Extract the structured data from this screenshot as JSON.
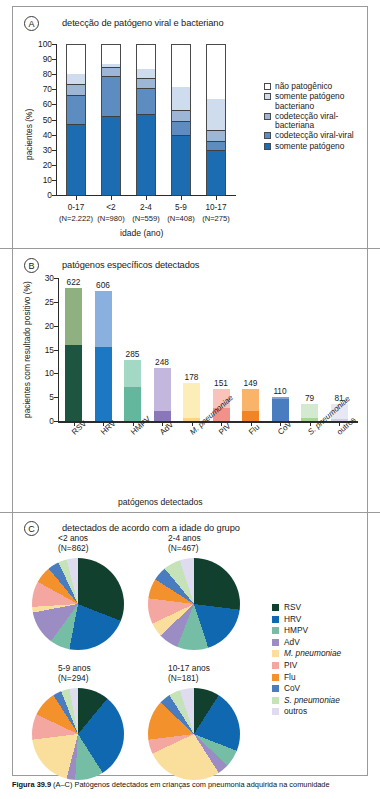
{
  "figure": {
    "caption_label": "Figura 39.9",
    "caption_text": "(A–C) Patógenos detectados em crianças com pneumonia adquirida na comunidade"
  },
  "panelA": {
    "letter": "A",
    "title": "detecção de patógeno viral e bacteriano",
    "ylabel": "pacientes (%)",
    "xlabel": "idade (ano)",
    "yticks": [
      "100",
      "90",
      "80",
      "70",
      "60",
      "50",
      "40",
      "30",
      "20",
      "10",
      "0"
    ],
    "legend": [
      {
        "label": "não patogênico",
        "color": "#ffffff"
      },
      {
        "label": "somente patógeno bacteriano",
        "color": "#cfdced"
      },
      {
        "label": "codetecção viral-bacteriana",
        "color": "#9db6d6"
      },
      {
        "label": "codetecção viral-viral",
        "color": "#5d8cc0"
      },
      {
        "label": "somente patógeno",
        "color": "#1b6cb0"
      }
    ],
    "categories": [
      {
        "age": "0-17",
        "n": "(N=2.222)"
      },
      {
        "age": "<2",
        "n": "(N=980)"
      },
      {
        "age": "2-4",
        "n": "(N=559)"
      },
      {
        "age": "5-9",
        "n": "(N=408)"
      },
      {
        "age": "10-17",
        "n": "(N=275)"
      }
    ]
  },
  "panelB": {
    "letter": "B",
    "title": "patógenos específicos detectados",
    "ylabel": "pacientes com resultado positivo (%)",
    "xlabel": "patógenos detectados",
    "yticks": [
      "30",
      "25",
      "20",
      "15",
      "10",
      "5",
      "0"
    ]
  },
  "panelC": {
    "letter": "C",
    "title": "detectados de acordo com a idade do grupo",
    "pies": [
      {
        "age": "<2 anos",
        "n": "(N=862)"
      },
      {
        "age": "2-4 anos",
        "n": "(N=467)"
      },
      {
        "age": "5-9 anos",
        "n": "(N=294)"
      },
      {
        "age": "10-17 anos",
        "n": "(N=181)"
      }
    ],
    "legend": [
      {
        "label": "RSV",
        "color": "#11402f",
        "italic": false
      },
      {
        "label": "HRV",
        "color": "#1068b0",
        "italic": false
      },
      {
        "label": "HMPV",
        "color": "#76bda6",
        "italic": false
      },
      {
        "label": "AdV",
        "color": "#9b8cc4",
        "italic": false
      },
      {
        "label": "M. pneumoniae",
        "color": "#fadf9c",
        "italic": true
      },
      {
        "label": "PIV",
        "color": "#f4a7a0",
        "italic": false
      },
      {
        "label": "Flu",
        "color": "#f3922c",
        "italic": false
      },
      {
        "label": "CoV",
        "color": "#4a7cc0",
        "italic": false
      },
      {
        "label": "S. pneumoniae",
        "color": "#c5e2b8",
        "italic": true
      },
      {
        "label": "outros",
        "color": "#dedcee",
        "italic": false
      }
    ]
  },
  "chart_data": [
    {
      "type": "bar",
      "panel": "A",
      "title": "detecção de patógeno viral e bacteriano",
      "xlabel": "idade (ano)",
      "ylabel": "pacientes (%)",
      "ylim": [
        0,
        100
      ],
      "grid": false,
      "stacked": true,
      "legend_position": "right",
      "categories": [
        "0-17",
        "<2",
        "2-4",
        "5-9",
        "10-17"
      ],
      "category_n": [
        "(N=2.222)",
        "(N=980)",
        "(N=559)",
        "(N=408)",
        "(N=275)"
      ],
      "series": [
        {
          "name": "somente patógeno",
          "color": "#1b6cb0",
          "values": [
            47,
            52,
            53.5,
            39.5,
            29.5
          ]
        },
        {
          "name": "codetecção viral-viral",
          "color": "#5d8cc0",
          "values": [
            19,
            27,
            17.5,
            9.5,
            6
          ]
        },
        {
          "name": "codetecção viral-bacteriana",
          "color": "#9db6d6",
          "values": [
            7.5,
            5.5,
            6.5,
            7,
            7.5
          ]
        },
        {
          "name": "somente patógeno bacteriano",
          "color": "#cfdced",
          "values": [
            7.5,
            3,
            6.5,
            16,
            21.5
          ]
        },
        {
          "name": "não patogênico",
          "color": "#ffffff",
          "values": [
            19,
            12.5,
            16,
            28,
            35.5
          ]
        }
      ]
    },
    {
      "type": "bar",
      "panel": "B",
      "title": "patógenos específicos detectados",
      "xlabel": "patógenos detectados",
      "ylabel": "pacientes com resultado positivo (%)",
      "ylim": [
        0,
        30
      ],
      "grid": false,
      "categories": [
        "RSV",
        "HRV",
        "HMPV",
        "AdV",
        "M. pneumoniae",
        "PIV",
        "Flu",
        "CoV",
        "S. pneumoniae",
        "outros"
      ],
      "counts": [
        622,
        606,
        285,
        248,
        178,
        151,
        149,
        110,
        79,
        81
      ],
      "values": [
        28.0,
        27.3,
        12.8,
        11.2,
        8.0,
        6.8,
        6.7,
        5.0,
        3.6,
        3.6
      ],
      "lower_values": [
        16.0,
        15.6,
        7.2,
        2.1,
        0.6,
        2.8,
        2.2,
        4.6,
        0.6,
        0.4
      ],
      "colors_lower": [
        "#1d5540",
        "#1d78c4",
        "#63b79d",
        "#8a77ba",
        "#f9d681",
        "#f0928a",
        "#f28426",
        "#4a7cc0",
        "#a8d496",
        "#cfcde6"
      ],
      "colors_upper": [
        "#8fb182",
        "#8ab0e0",
        "#a3d8c4",
        "#c4b7dd",
        "#fdedb8",
        "#f9c2bb",
        "#f9b46a",
        "#7ba3d4",
        "#d4ead0",
        "#e8e7f4"
      ]
    },
    {
      "type": "pie",
      "panel": "C",
      "title": "detectados de acordo com a idade do grupo",
      "legend_position": "right",
      "labels": [
        "RSV",
        "HRV",
        "HMPV",
        "AdV",
        "M. pneumoniae",
        "PIV",
        "Flu",
        "CoV",
        "S. pneumoniae",
        "outros"
      ],
      "colors": [
        "#11402f",
        "#1068b0",
        "#76bda6",
        "#9b8cc4",
        "#fadf9c",
        "#f4a7a0",
        "#f3922c",
        "#4a7cc0",
        "#c5e2b8",
        "#dedcee"
      ],
      "pies": [
        {
          "name": "<2 anos",
          "n": 862,
          "values": [
            31,
            22,
            7,
            12,
            2,
            9,
            6,
            4,
            3,
            4
          ]
        },
        {
          "name": "2-4 anos",
          "n": 467,
          "values": [
            27,
            18,
            11,
            7,
            5,
            9,
            7,
            5,
            6,
            5
          ]
        },
        {
          "name": "5-9 anos",
          "n": 294,
          "values": [
            11,
            30,
            10,
            3,
            19,
            9,
            9,
            3,
            3,
            3
          ]
        },
        {
          "name": "10-17 anos",
          "n": 181,
          "values": [
            9,
            22,
            6,
            4,
            27,
            5,
            14,
            4,
            4,
            5
          ]
        }
      ]
    }
  ]
}
